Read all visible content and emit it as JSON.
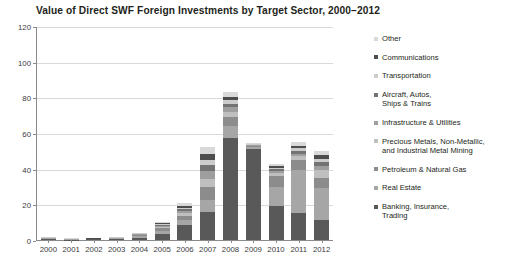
{
  "chart_data": {
    "type": "bar",
    "stacked": true,
    "title": "Value of Direct SWF Foreign Investments by Target Sector, 2000–2012",
    "xlabel": "",
    "ylabel": "",
    "ylim": [
      0,
      120
    ],
    "yticks": [
      0,
      20,
      40,
      60,
      80,
      100,
      120
    ],
    "grid": true,
    "legend_position": "right",
    "categories": [
      "2000",
      "2001",
      "2002",
      "2003",
      "2004",
      "2005",
      "2006",
      "2007",
      "2008",
      "2009",
      "2010",
      "2011",
      "2012"
    ],
    "series": [
      {
        "name": "Banking, Insurance, Trading",
        "color": "#595959",
        "values": [
          0.6,
          0.2,
          0.3,
          0.5,
          1.2,
          3.2,
          8.5,
          15.5,
          57.0,
          51.0,
          19.0,
          15.0,
          11.0
        ]
      },
      {
        "name": "Real Estate",
        "color": "#a6a6a6",
        "values": [
          0.3,
          0.2,
          0.2,
          0.4,
          1.0,
          2.0,
          3.0,
          7.0,
          7.0,
          1.0,
          11.0,
          24.0,
          18.0
        ]
      },
      {
        "name": "Petroleum & Natural Gas",
        "color": "#8c8c8c",
        "values": [
          0.2,
          0.1,
          0.1,
          0.2,
          0.6,
          1.4,
          2.0,
          7.0,
          5.0,
          0.5,
          6.0,
          6.0,
          6.0
        ]
      },
      {
        "name": "Precious Metals, Non-Metallic, and Industrial Metal Mining",
        "color": "#bfbfbf",
        "values": [
          0.1,
          0.1,
          0.1,
          0.1,
          0.3,
          0.8,
          1.5,
          5.0,
          3.0,
          0.4,
          1.5,
          2.0,
          4.0
        ]
      },
      {
        "name": "Infrastructure & Utilities",
        "color": "#9e9e9e",
        "values": [
          0.1,
          0.05,
          0.05,
          0.1,
          0.2,
          0.6,
          1.2,
          4.0,
          2.5,
          0.3,
          1.2,
          1.5,
          2.5
        ]
      },
      {
        "name": "Aircraft, Autos, Ships & Trains",
        "color": "#737373",
        "values": [
          0.1,
          0.05,
          0.05,
          0.1,
          0.2,
          0.5,
          1.0,
          3.5,
          2.0,
          0.3,
          1.0,
          1.5,
          2.0
        ]
      },
      {
        "name": "Transportation",
        "color": "#cccccc",
        "values": [
          0.05,
          0.05,
          0.05,
          0.05,
          0.2,
          0.5,
          1.0,
          3.0,
          1.8,
          0.2,
          0.8,
          1.5,
          2.0
        ]
      },
      {
        "name": "Communications",
        "color": "#4d4d4d",
        "values": [
          0.05,
          0.05,
          0.05,
          0.05,
          0.2,
          0.5,
          1.0,
          3.0,
          1.7,
          0.2,
          0.8,
          1.5,
          2.0
        ]
      },
      {
        "name": "Other",
        "color": "#d9d9d9",
        "values": [
          0.1,
          0.1,
          0.1,
          0.1,
          0.3,
          0.8,
          1.8,
          4.0,
          3.0,
          0.5,
          1.5,
          2.0,
          2.5
        ]
      }
    ],
    "legend_order": [
      "Other",
      "Communications",
      "Transportation",
      "Aircraft, Autos,\nShips & Trains",
      "Infrastructure & Utilities",
      "Precious Metals, Non-Metallic,\nand Industrial Metal Mining",
      "Petroleum & Natural Gas",
      "Real Estate",
      "Banking, Insurance,\nTrading"
    ]
  },
  "legend": {
    "items": [
      {
        "label": "Other",
        "color": "#d9d9d9"
      },
      {
        "label": "Communications",
        "color": "#4d4d4d"
      },
      {
        "label": "Transportation",
        "color": "#cccccc"
      },
      {
        "label": "Aircraft, Autos,\nShips & Trains",
        "color": "#737373"
      },
      {
        "label": "Infrastructure & Utilities",
        "color": "#9e9e9e"
      },
      {
        "label": "Precious Metals, Non-Metallic,\nand Industrial Metal Mining",
        "color": "#bfbfbf"
      },
      {
        "label": "Petroleum & Natural Gas",
        "color": "#8c8c8c"
      },
      {
        "label": "Real Estate",
        "color": "#a6a6a6"
      },
      {
        "label": "Banking, Insurance,\nTrading",
        "color": "#595959"
      }
    ]
  }
}
